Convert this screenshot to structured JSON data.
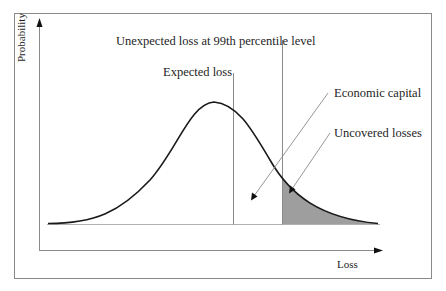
{
  "diagram": {
    "axes": {
      "y_label": "Probability",
      "x_label": "Loss"
    },
    "labels": {
      "unexpected_loss": "Unexpected loss at 99th percentile level",
      "expected_loss": "Expected loss",
      "economic_capital": "Economic capital",
      "uncovered_losses": "Uncovered losses"
    },
    "colors": {
      "curve": "#1a1a1a",
      "shaded_tail": "#9e9e9e",
      "guide_lines": "#8a8a8a",
      "frame": "#8a8a8a"
    },
    "markers": {
      "expected_loss_x": 233,
      "percentile_99_x": 282,
      "peak_x": 214
    }
  }
}
